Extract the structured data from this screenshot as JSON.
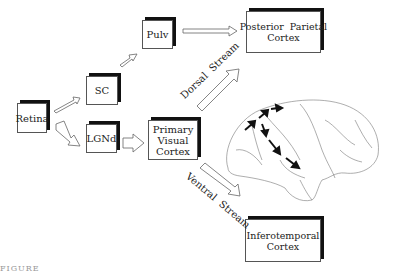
{
  "boxes": {
    "retina": {
      "label": "Retina"
    },
    "sc": {
      "label": "SC"
    },
    "pulv": {
      "label": "Pulv"
    },
    "lgnd": {
      "label": "LGNd"
    },
    "pvc": {
      "line1": "Primary",
      "line2": "Visual",
      "line3": "Cortex"
    },
    "ppc": {
      "line1": "Posterior  Parietal",
      "line2": "Cortex"
    },
    "itc": {
      "line1": "Inferotemporal",
      "line2": "Cortex"
    }
  },
  "streams": {
    "dorsal": "Dorsal  Stream",
    "ventral": "Ventral  Stream"
  },
  "caption": "FIGURE"
}
